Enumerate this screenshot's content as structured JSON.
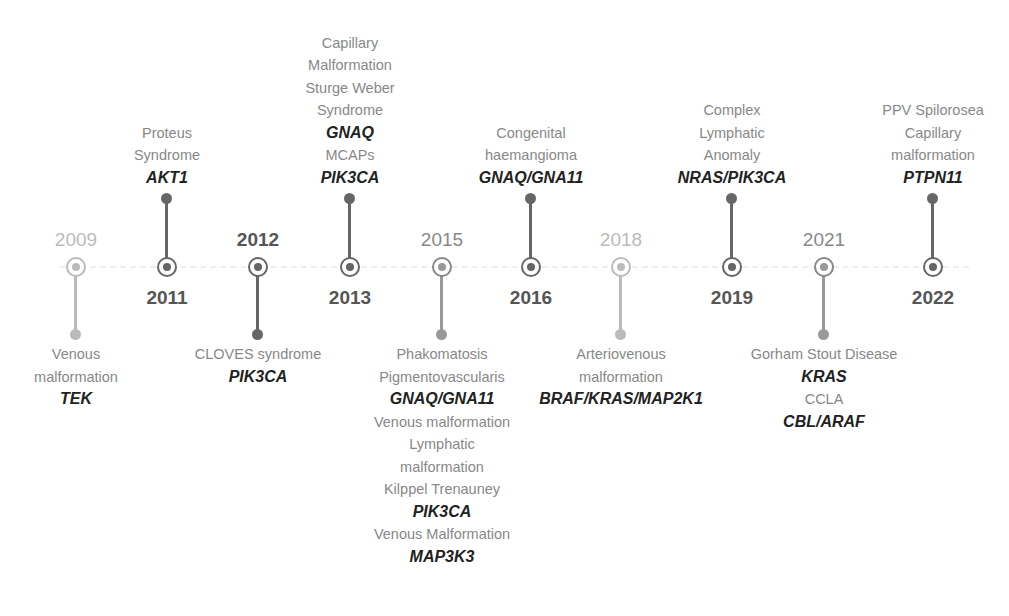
{
  "events": [
    {
      "year": "2009",
      "x": 76,
      "dir": "down",
      "style": "light",
      "lines": [
        {
          "t": "Venous"
        },
        {
          "t": "malformation"
        },
        {
          "t": "TEK",
          "gene": true
        }
      ]
    },
    {
      "year": "2011",
      "x": 167,
      "dir": "up",
      "style": "dark",
      "lines": [
        {
          "t": "Proteus"
        },
        {
          "t": "Syndrome"
        },
        {
          "t": "AKT1",
          "gene": true
        }
      ]
    },
    {
      "year": "2012",
      "x": 258,
      "dir": "down",
      "style": "dark",
      "lines": [
        {
          "t": "CLOVES syndrome"
        },
        {
          "t": "PIK3CA",
          "gene": true
        }
      ]
    },
    {
      "year": "2013",
      "x": 350,
      "dir": "up",
      "style": "dark",
      "lines": [
        {
          "t": "Capillary"
        },
        {
          "t": "Malformation"
        },
        {
          "t": "Sturge Weber"
        },
        {
          "t": "Syndrome"
        },
        {
          "t": "GNAQ",
          "gene": true
        },
        {
          "t": "MCAPs"
        },
        {
          "t": "PIK3CA",
          "gene": true
        }
      ]
    },
    {
      "year": "2015",
      "x": 442,
      "dir": "down",
      "style": "mid",
      "lines": [
        {
          "t": "Phakomatosis"
        },
        {
          "t": "Pigmentovascularis"
        },
        {
          "t": "GNAQ/GNA11",
          "gene": true
        },
        {
          "t": "Venous malformation"
        },
        {
          "t": "Lymphatic"
        },
        {
          "t": "malformation"
        },
        {
          "t": "Kilppel Trenauney"
        },
        {
          "t": "PIK3CA",
          "gene": true
        },
        {
          "t": "Venous Malformation"
        },
        {
          "t": "MAP3K3",
          "gene": true
        }
      ]
    },
    {
      "year": "2016",
      "x": 531,
      "dir": "up",
      "style": "dark",
      "lines": [
        {
          "t": "Congenital"
        },
        {
          "t": "haemangioma"
        },
        {
          "t": "GNAQ/GNA11",
          "gene": true
        }
      ]
    },
    {
      "year": "2018",
      "x": 621,
      "dir": "down",
      "style": "light",
      "lines": [
        {
          "t": "Arteriovenous"
        },
        {
          "t": "malformation"
        },
        {
          "t": "BRAF/KRAS/MAP2K1",
          "gene": true
        }
      ]
    },
    {
      "year": "2019",
      "x": 732,
      "dir": "up",
      "style": "dark",
      "lines": [
        {
          "t": "Complex"
        },
        {
          "t": "Lymphatic"
        },
        {
          "t": "Anomaly"
        },
        {
          "t": "NRAS/PIK3CA",
          "gene": true
        }
      ]
    },
    {
      "year": "2021",
      "x": 824,
      "dir": "down",
      "style": "mid",
      "lines": [
        {
          "t": "Gorham Stout Disease"
        },
        {
          "t": "KRAS",
          "gene": true
        },
        {
          "t": "CCLA"
        },
        {
          "t": "CBL/ARAF",
          "gene": true
        }
      ]
    },
    {
      "year": "2022",
      "x": 933,
      "dir": "up",
      "style": "dark",
      "lines": [
        {
          "t": "PPV Spilorosea"
        },
        {
          "t": "Capillary"
        },
        {
          "t": "malformation"
        },
        {
          "t": "PTPN11",
          "gene": true
        }
      ]
    }
  ]
}
